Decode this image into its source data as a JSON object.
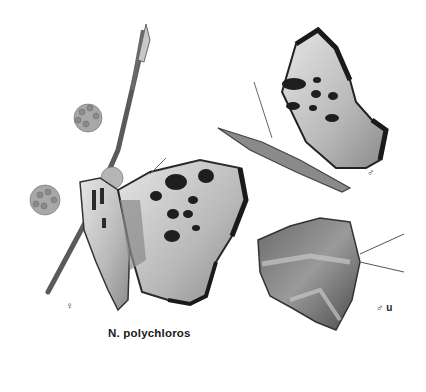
{
  "plate": {
    "caption": "N. polychloros",
    "background": "#ffffff",
    "figures": [
      {
        "id": "female-upperside",
        "label": "♀",
        "description": "Female, wings open, perched on flowering twig"
      },
      {
        "id": "male-upperside",
        "label": "♂",
        "description": "Male, side view, wings raised"
      },
      {
        "id": "male-underside",
        "label": "♂ u",
        "description": "Male underside"
      }
    ]
  },
  "colors": {
    "wing_light": "#d9d9d9",
    "wing_mid": "#9a9a9a",
    "wing_dark": "#2a2a2a",
    "twig": "#5a5a5a"
  }
}
